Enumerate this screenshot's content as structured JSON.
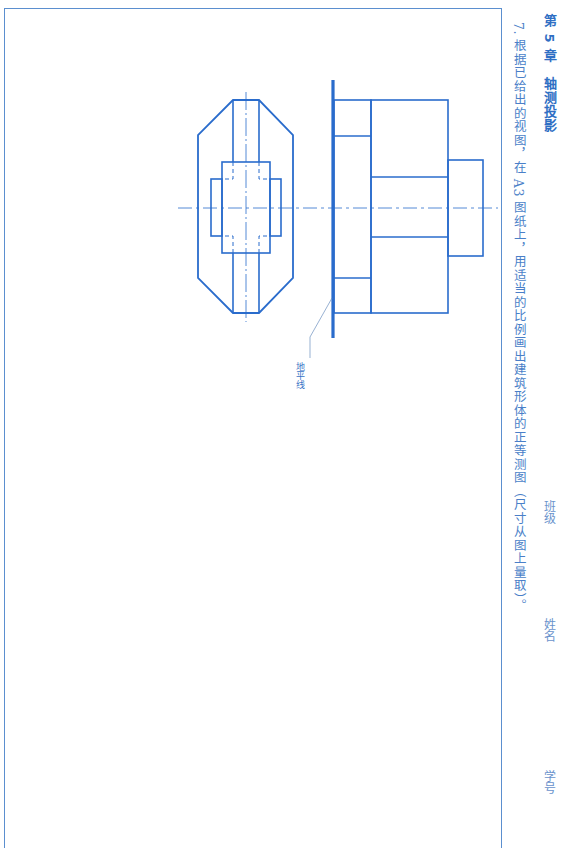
{
  "header": {
    "chapter": "第 5 章　轴测投影",
    "fields": [
      "班级",
      "姓名",
      "学号"
    ]
  },
  "exercise": {
    "text": "7. 根据已给出的视图，在 A3 图纸上，用适当的比例画出建筑形体的正等测图（尺寸从图上量取）。"
  },
  "drawing": {
    "ground_line_label": "地平线",
    "line_color": "#2a6ccc",
    "views": [
      "plan-view",
      "elevation-view"
    ]
  }
}
